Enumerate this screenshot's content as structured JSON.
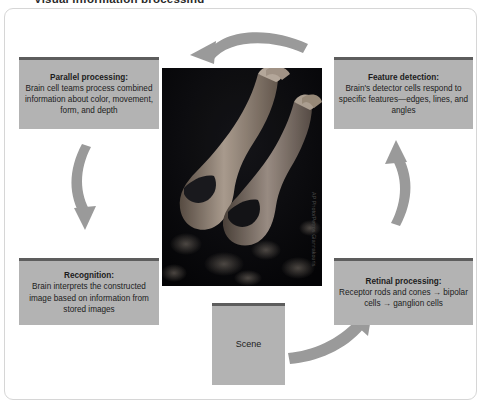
{
  "title": "Visual information processing",
  "diagram": {
    "boxes": {
      "parallel": {
        "heading": "Parallel processing:",
        "body": "Brain cell teams process combined information about color, movement, form, and depth"
      },
      "feature": {
        "heading": "Feature detection:",
        "body": "Brain's detector cells respond to specific features—edges, lines, and angles"
      },
      "recognition": {
        "heading": "Recognition:",
        "body": "Brain interprets the constructed image based on information from stored images"
      },
      "retinal": {
        "heading": "Retinal processing:",
        "body": "Receptor rods and cones → bipolar cells → ganglion cells"
      },
      "scene": {
        "label": "Scene"
      }
    },
    "photo": {
      "caption": "Two synchronized divers descending head-first against a dark background",
      "credit": "AP Photo/Petros Giannakouris"
    },
    "arrows": [
      {
        "name": "arrow-top",
        "direction": "right-to-left"
      },
      {
        "name": "arrow-left",
        "direction": "downward"
      },
      {
        "name": "arrow-right",
        "direction": "upward"
      },
      {
        "name": "arrow-bottom",
        "direction": "up-right"
      }
    ],
    "colors": {
      "box_fill": "#b3b3b3",
      "box_header_bar": "#5d5d5d",
      "arrow_fill": "#9a9a9a",
      "frame_border": "#d6d6d6",
      "text": "#1c1c1c",
      "photo_background": "#0a0a0c"
    }
  }
}
